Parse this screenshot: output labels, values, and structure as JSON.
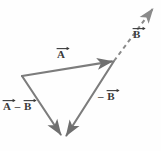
{
  "figure": {
    "background_color": "#fefefe",
    "stroke_color": "#7c7c7c",
    "label_color": "#3a3a3a",
    "width": 161,
    "height": 151
  },
  "labels": {
    "a": {
      "symbol": "A",
      "operator": "",
      "second_symbol": ""
    },
    "b": {
      "symbol": "B",
      "operator": "",
      "second_symbol": ""
    },
    "neg_b": {
      "operator": "–",
      "symbol": "B",
      "second_symbol": ""
    },
    "a_minus_b": {
      "symbol": "A",
      "operator": "–",
      "second_symbol": "B"
    }
  },
  "vectors": [
    {
      "name": "vector-a",
      "label": "A",
      "style": "solid",
      "color": "#7c7c7c",
      "start": [
        22,
        76
      ],
      "end": [
        114,
        61
      ],
      "arrowhead": "end"
    },
    {
      "name": "vector-neg-b",
      "label": "-B",
      "style": "solid",
      "color": "#7c7c7c",
      "start": [
        114,
        61
      ],
      "end": [
        65,
        138
      ],
      "arrowhead": "end"
    },
    {
      "name": "vector-a-minus-b",
      "label": "A-B",
      "style": "solid",
      "color": "#7c7c7c",
      "start": [
        22,
        76
      ],
      "end": [
        62,
        137
      ],
      "arrowhead": "end"
    },
    {
      "name": "vector-b-dashed",
      "label": "B",
      "style": "dashed",
      "color": "#8a8a8a",
      "start": [
        114,
        61
      ],
      "end": [
        155,
        6
      ],
      "arrowhead": "end"
    }
  ]
}
